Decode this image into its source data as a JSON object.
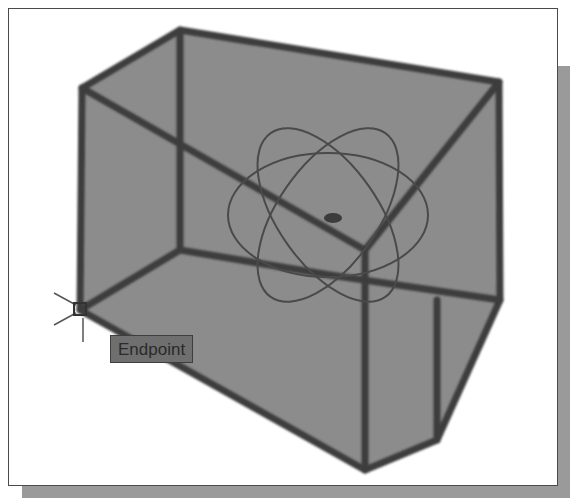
{
  "viewport": {
    "background": "#ffffff",
    "shadow_color": "#9a9a9a",
    "frame_border": "#4a4a4a"
  },
  "model": {
    "type": "3d-wireframe-solid",
    "fill_color": "#8c8c8c",
    "edge_color": "#3c3c3c",
    "visual_style": "shaded-with-edges"
  },
  "gizmo": {
    "type": "orbit-gizmo",
    "color": "#4a4a4a"
  },
  "cursor": {
    "type": "osnap-crosshair",
    "position": [
      80,
      310
    ]
  },
  "osnap_tooltip": {
    "label": "Endpoint",
    "marker": "endpoint-square"
  }
}
